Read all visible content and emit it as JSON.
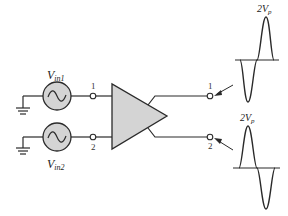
{
  "diagram": {
    "type": "differential-amplifier-circuit",
    "colors": {
      "line": "#2a2a2a",
      "fill": "#d4d4d4",
      "background": "#ffffff"
    },
    "sources": [
      {
        "id": "vin1",
        "label_main": "V",
        "label_sub": "in1",
        "terminal": "1"
      },
      {
        "id": "vin2",
        "label_main": "V",
        "label_sub": "in2",
        "terminal": "2"
      }
    ],
    "amplifier": {
      "symbol": "triangle"
    },
    "outputs": [
      {
        "terminal": "1",
        "waveform_label_main": "2V",
        "waveform_label_sub": "p",
        "phase": "inverted"
      },
      {
        "terminal": "2",
        "waveform_label_main": "2V",
        "waveform_label_sub": "p",
        "phase": "non-inverted"
      }
    ]
  }
}
